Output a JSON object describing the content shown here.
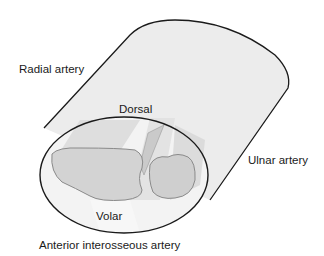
{
  "diagram": {
    "type": "anatomical cross-section illustration",
    "labels": {
      "radial_artery": "Radial artery",
      "dorsal": "Dorsal",
      "ulnar_artery": "Ulnar artery",
      "volar": "Volar",
      "anterior_interosseous_artery": "Anterior interosseous artery"
    },
    "colors": {
      "outline": "#1a1a1a",
      "cylinder_fill": "#ececec",
      "cross_section_fill": "#f2f2f2",
      "bone_fill": "#cfcfcf",
      "bone_outline": "#8a8a8a",
      "shadow_band": "#d6d6d6"
    }
  }
}
